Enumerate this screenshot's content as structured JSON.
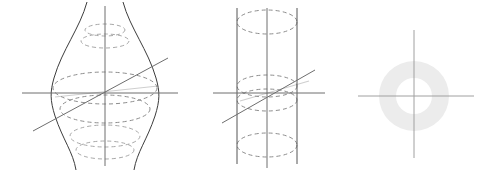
{
  "page": {
    "background_color": "#ffffff",
    "width": 496,
    "height": 172,
    "figure_count": 3
  },
  "style": {
    "outline_color": "#3c3c3c",
    "dashed_color": "#8d8d8d",
    "dashed_faint_color": "#a8a8a8",
    "axis_color": "#6e6e6e",
    "axis_light_color": "#a0a0a0",
    "axis_pale_color": "#cfcfcf",
    "ring_fill_color": "#ececec",
    "dash_pattern": "4 3",
    "stroke_width": 1
  },
  "figures": [
    {
      "id": "hyperboloid",
      "name": "hyperboloid-of-one-sheet",
      "index": 1,
      "label": "",
      "center": {
        "x": 105,
        "y": 93
      },
      "waist_radius_x": 53,
      "waist_radius_y": 16,
      "neck_radius_x": 18,
      "vertical_axis": {
        "x": 105,
        "y1": 6,
        "y2": 166
      },
      "horizontal_axis": {
        "x1": 22,
        "x2": 178,
        "y": 93
      },
      "slant_axis": {
        "x1": 33,
        "y1": 131,
        "x2": 168,
        "y2": 58
      },
      "highlight_chord": {
        "x1": 55,
        "y1": 96,
        "x2": 157,
        "y2": 88
      },
      "dashed_ellipses": [
        {
          "cy": 30,
          "rx": 20,
          "ry": 6
        },
        {
          "cy": 40,
          "rx": 23,
          "ry": 6
        },
        {
          "cy": 88,
          "rx": 52,
          "ry": 16
        },
        {
          "cy": 110,
          "rx": 44,
          "ry": 14
        },
        {
          "cy": 137,
          "rx": 35,
          "ry": 11
        },
        {
          "cy": 150,
          "rx": 30,
          "ry": 9
        }
      ]
    },
    {
      "id": "cylinder",
      "name": "circular-cylinder",
      "index": 2,
      "label": "",
      "center": {
        "x": 267,
        "y": 93
      },
      "radius_x": 30,
      "radius_y": 13,
      "wall_left_x": 237,
      "wall_right_x": 297,
      "wall_top_y": 8,
      "wall_bottom_y": 164,
      "vertical_axis": {
        "x": 267,
        "y1": 8,
        "y2": 168
      },
      "horizontal_axis": {
        "x1": 213,
        "x2": 325,
        "y": 93
      },
      "slant_axis": {
        "x1": 222,
        "y1": 123,
        "x2": 315,
        "y2": 70
      },
      "highlight_chord": {
        "x1": 240,
        "y1": 100,
        "x2": 308,
        "y2": 82
      },
      "dashed_ellipses": [
        {
          "cy": 22,
          "rx": 30,
          "ry": 12
        },
        {
          "cy": 86,
          "rx": 30,
          "ry": 11
        },
        {
          "cy": 99,
          "rx": 30,
          "ry": 11
        },
        {
          "cy": 145,
          "rx": 30,
          "ry": 12
        }
      ]
    },
    {
      "id": "annulus",
      "name": "annulus-cross-section",
      "index": 3,
      "label": "",
      "center": {
        "x": 414,
        "y": 96
      },
      "outer_radius": 35,
      "inner_radius": 18,
      "fill_color": "#ececec",
      "vertical_axis": {
        "x": 414,
        "y1": 30,
        "y2": 158
      },
      "horizontal_axis": {
        "x1": 358,
        "x2": 474,
        "y": 96
      }
    }
  ]
}
